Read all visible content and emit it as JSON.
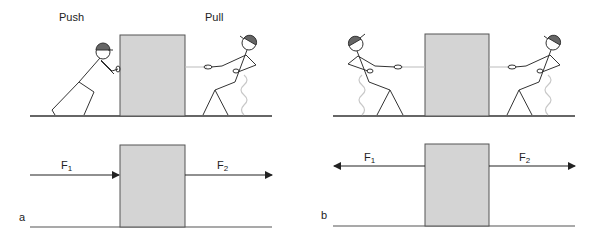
{
  "panels": {
    "a": {
      "letter": "a",
      "top_labels": {
        "push": "Push",
        "pull": "Pull"
      },
      "forces": [
        {
          "name": "F",
          "sub": "1",
          "direction": "right",
          "pushes_on_box": true
        },
        {
          "name": "F",
          "sub": "2",
          "direction": "right",
          "pulls_from_box": true
        }
      ]
    },
    "b": {
      "letter": "b",
      "forces": [
        {
          "name": "F",
          "sub": "1",
          "direction": "left"
        },
        {
          "name": "F",
          "sub": "2",
          "direction": "right"
        }
      ]
    }
  },
  "colors": {
    "box_fill": "#d4d4d4",
    "box_stroke": "#555555",
    "line": "#333333",
    "rope": "#bbbbbb",
    "helmet": "#666666",
    "spring": "#c8c8c8"
  }
}
